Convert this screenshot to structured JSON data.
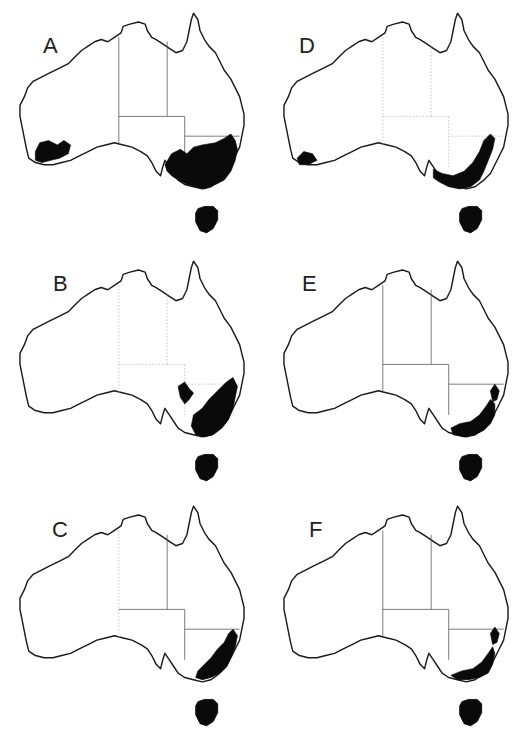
{
  "figure": {
    "colors": {
      "background": "#ffffff",
      "coastline": "#1a1a1a",
      "distribution": "#0a0a0a",
      "state_border": "#555555"
    }
  },
  "panels": [
    {
      "id": "A",
      "label": "A",
      "col": 0,
      "row": 0,
      "left": 0,
      "top": 0,
      "label_pos": [
        43,
        33
      ],
      "borders": "solid",
      "distribution_regions": [
        "south-west Western Australia",
        "south-east Australia (NSW, Victoria, SE South Australia)",
        "Tasmania"
      ]
    },
    {
      "id": "D",
      "label": "D",
      "col": 1,
      "row": 0,
      "left": 264,
      "top": 0,
      "label_pos": [
        35,
        33
      ],
      "borders": "faint",
      "distribution_regions": [
        "far south-west Western Australia",
        "south-east coast and ranges (NSW, Victoria)",
        "Tasmania"
      ]
    },
    {
      "id": "B",
      "label": "B",
      "col": 0,
      "row": 1,
      "left": 0,
      "top": 248,
      "label_pos": [
        53,
        23
      ],
      "borders": "faint",
      "distribution_regions": [
        "Flinders Ranges area SA",
        "south-east Australia (NSW, Victoria)",
        "Tasmania"
      ]
    },
    {
      "id": "E",
      "label": "E",
      "col": 1,
      "row": 1,
      "left": 264,
      "top": 248,
      "label_pos": [
        38,
        23
      ],
      "borders": "solid",
      "distribution_regions": [
        "NSW east coast ranges",
        "southern Victoria and SE NSW",
        "Tasmania"
      ]
    },
    {
      "id": "C",
      "label": "C",
      "col": 0,
      "row": 2,
      "left": 0,
      "top": 493,
      "label_pos": [
        52,
        24
      ],
      "borders": "mixed",
      "distribution_regions": [
        "eastern NSW ranges",
        "Victoria and SE NSW",
        "Tasmania"
      ]
    },
    {
      "id": "F",
      "label": "F",
      "col": 1,
      "row": 2,
      "left": 264,
      "top": 493,
      "label_pos": [
        45,
        24
      ],
      "borders": "solid",
      "distribution_regions": [
        "NSW east coast ranges",
        "southern Victoria alpine region",
        "Tasmania"
      ]
    }
  ],
  "geometry": {
    "coast_path": "M18,96 L22,88 L25,80 L30,74 L38,70 L46,66 L54,62 L62,58 L68,52 L74,46 L80,42 L86,38 L92,36 L98,38 L104,34 L110,30 L112,24 L118,22 L126,20 L132,22 L134,28 L138,34 L142,36 L148,40 L154,44 L160,48 L166,46 L170,38 L172,28 L174,18 L176,12 L180,18 L182,28 L186,36 L190,42 L196,48 L200,56 L204,64 L210,72 L214,80 L218,88 L220,96 L222,104 L222,114 L220,124 L218,134 L214,142 L210,150 L206,158 L200,164 L192,170 L184,172 L176,170 L168,168 L162,164 L158,158 L154,152 L150,146 L148,152 L146,160 L142,156 L138,148 L134,142 L128,138 L120,134 L112,132 L104,130 L96,132 L88,134 L80,138 L72,142 L64,146 L56,148 L48,150 L40,150 L32,148 L26,144 L24,136 L22,126 L20,116 L18,106 Z",
    "tasmania_path": "M180,190 L186,188 L194,188 L198,192 L198,200 L194,208 L188,212 L182,210 L178,202 L178,194 Z",
    "border_wa": "M108,34 L108,132",
    "border_nt_sa": "M108,106 L152,106",
    "border_qld_nt": "M152,38 L152,106",
    "border_sa_east": "M168,106 L168,152",
    "border_qld_sa": "M152,106 L168,106",
    "border_nsw_qld": "M168,124 L218,124"
  },
  "distributions": {
    "A": [
      "M32,138 L36,130 L44,128 L52,132 L58,128 L64,132 L62,140 L54,144 L46,146 L38,148 L32,146 Z",
      "M150,150 L156,140 L164,136 L170,140 L176,134 L184,132 L196,130 L204,126 L210,122 L214,128 L216,136 L214,146 L210,156 L204,164 L196,168 L186,172 L178,170 L170,168 L162,164 L156,160 L152,156 Z"
    ],
    "D": [
      "M30,144 L36,138 L44,140 L48,146 L40,150 L32,150 Z",
      "M154,154 L162,158 L172,160 L182,156 L190,148 L196,138 L200,128 L206,122 L210,126 L208,136 L204,146 L200,156 L196,164 L188,170 L178,172 L168,170 L160,166 L154,162 Z"
    ],
    "B": [
      "M162,126 L168,122 L172,128 L176,132 L172,138 L168,142 L164,136 Z",
      "M176,152 L184,146 L190,138 L198,130 L206,122 L212,118 L216,126 L214,136 L212,146 L208,156 L202,164 L194,170 L186,172 L178,170 L174,162 Z"
    ],
    "E": [
      "M206,130 L210,124 L214,130 L212,138 L208,140 Z",
      "M170,164 L178,160 L188,158 L196,152 L202,144 L206,138 L210,142 L210,152 L206,160 L200,166 L192,170 L182,172 L172,170 Z"
    ],
    "C": [
      "M180,162 L186,156 L192,150 L198,142 L204,136 L208,128 L212,124 L216,130 L214,140 L210,150 L206,158 L200,164 L192,168 L184,170 L178,168 Z"
    ],
    "F": [
      "M206,128 L210,122 L214,128 L212,136 L208,138 Z",
      "M170,166 L180,162 L190,160 L198,154 L204,146 L208,140 L210,146 L208,156 L204,164 L196,168 L186,170 L176,170 Z"
    ]
  },
  "chart_data": {
    "type": "map",
    "title": "",
    "panels": [
      "A",
      "B",
      "C",
      "D",
      "E",
      "F"
    ],
    "layout": {
      "rows": 3,
      "cols": 2,
      "order": [
        [
          "A",
          "D"
        ],
        [
          "B",
          "E"
        ],
        [
          "C",
          "F"
        ]
      ]
    },
    "legend": "Black shading = predicted/observed distribution",
    "extent_notes": {
      "A": "Widest: SW Western Australia + large SE Australia region + Tasmania",
      "D": "SW WA tip + SE coastal belt + Tasmania",
      "B": "SE Australia incl. Flinders Ranges patch + Tasmania",
      "C": "Eastern NSW ranges to Victoria + Tasmania",
      "E": "Narrow SE coastal/alpine belt + NE NSW patch + Tasmania",
      "F": "Narrow SE coastal/alpine belt + NE NSW patch + Tasmania"
    }
  }
}
